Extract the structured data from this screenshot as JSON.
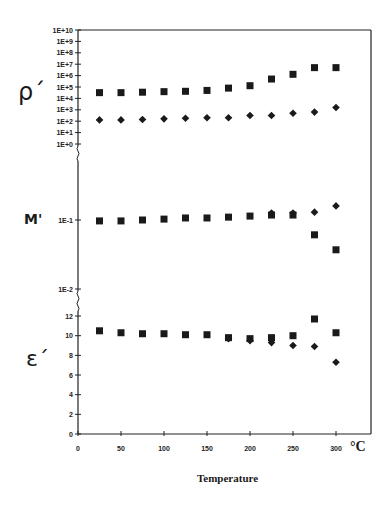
{
  "chart_data": {
    "type": "scatter",
    "title": "",
    "xlabel": "Temperature",
    "x_unit": "°C",
    "xlim": [
      0,
      300
    ],
    "x_ticks": [
      0,
      50,
      100,
      150,
      200,
      250,
      300
    ],
    "grid": false,
    "legend": null,
    "x": [
      25,
      50,
      75,
      100,
      125,
      150,
      175,
      200,
      225,
      250,
      275,
      300
    ],
    "panels": [
      {
        "name": "rho",
        "ylabel": "ρ´",
        "scale": "log",
        "ylim": [
          1,
          10000000000.0
        ],
        "y_ticks": [
          "1E+10",
          "1E+9",
          "1E+8",
          "1E+7",
          "1E+6",
          "1E+5",
          "1E+4",
          "1E+3",
          "1E+2",
          "1E+1",
          "1E+0"
        ],
        "series": [
          {
            "name": "square",
            "marker": "square",
            "values": [
              32000.0,
              32000.0,
              35000.0,
              39000.0,
              42000.0,
              50000.0,
              80000.0,
              130000.0,
              500000.0,
              1300000.0,
              5000000.0,
              5000000.0
            ]
          },
          {
            "name": "diamond",
            "marker": "diamond",
            "values": [
              130.0,
              130.0,
              140.0,
              160.0,
              180.0,
              200.0,
              200.0,
              320.0,
              320.0,
              500.0,
              630.0,
              1600.0
            ]
          }
        ]
      },
      {
        "name": "M",
        "ylabel": "M'",
        "scale": "log",
        "ylim": [
          0.01,
          0.3
        ],
        "y_ticks": [
          "1E-1",
          "1E-2"
        ],
        "series": [
          {
            "name": "square",
            "marker": "square",
            "values": [
              0.097,
              0.097,
              0.1,
              0.103,
              0.107,
              0.107,
              0.11,
              0.114,
              0.118,
              0.118,
              0.061,
              0.037
            ]
          },
          {
            "name": "diamond",
            "marker": "diamond",
            "values": [
              null,
              null,
              null,
              null,
              null,
              null,
              null,
              null,
              0.126,
              0.126,
              0.13,
              0.16
            ]
          }
        ]
      },
      {
        "name": "epsilon",
        "ylabel": "ε´",
        "scale": "linear",
        "ylim": [
          0,
          12
        ],
        "y_ticks": [
          "12",
          "10",
          "8",
          "6",
          "4",
          "2",
          "0"
        ],
        "series": [
          {
            "name": "square",
            "marker": "square",
            "values": [
              10.5,
              10.3,
              10.2,
              10.2,
              10.1,
              10.1,
              9.8,
              9.7,
              9.8,
              10.0,
              11.7,
              10.3
            ]
          },
          {
            "name": "diamond",
            "marker": "diamond",
            "values": [
              null,
              null,
              null,
              null,
              null,
              null,
              9.7,
              9.5,
              9.3,
              9.0,
              8.9,
              7.3
            ]
          }
        ]
      }
    ]
  },
  "labels": {
    "rho": "ρ´",
    "m": "M'",
    "eps": "ε´",
    "xlabel": "Temperature",
    "unit": "°C"
  }
}
